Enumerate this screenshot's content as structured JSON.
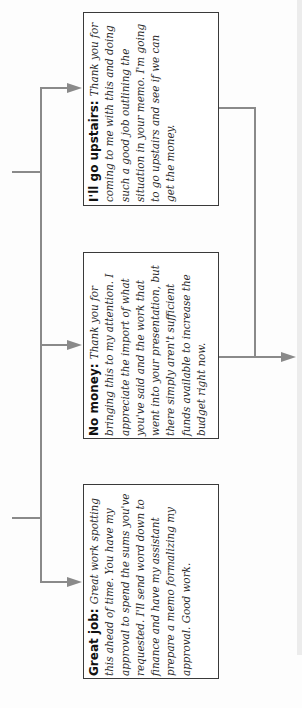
{
  "diagram": {
    "type": "decision-flow",
    "orientation": "rotated-90-ccw",
    "colors": {
      "connector": "#8a8a8a",
      "box_border": "#3a3a3a",
      "text": "#2a2a2a",
      "title": "#111111"
    },
    "boxes": [
      {
        "id": "upstairs",
        "title": "I'll go upstairs:",
        "body": "Thank you for coming to me with this and doing such a good job outlining the situation in your memo. I'm going to go upstairs and see if we can get the money."
      },
      {
        "id": "no-money",
        "title": "No money:",
        "body": "Thank you for bringing this to my attention. I appreciate the import of what you've said and the work that went into your presentation, but there simply aren't sufficient funds available to increase the budget right now."
      },
      {
        "id": "great-job",
        "title": "Great job:",
        "body": "Great work spotting this ahead of time. You have my approval to spend the sums you've requested. I'll send word down to finance and have my assistant prepare a memo formalizing my approval. Good work."
      }
    ],
    "connectors": [
      {
        "from": "incoming-top",
        "to": "trunk"
      },
      {
        "from": "incoming-bottom",
        "to": "trunk"
      },
      {
        "from": "trunk",
        "to": "upstairs"
      },
      {
        "from": "trunk",
        "to": "no-money"
      },
      {
        "from": "trunk",
        "to": "great-job"
      },
      {
        "from": "upstairs",
        "to": "outgoing"
      },
      {
        "from": "no-money",
        "to": "outgoing"
      }
    ]
  }
}
